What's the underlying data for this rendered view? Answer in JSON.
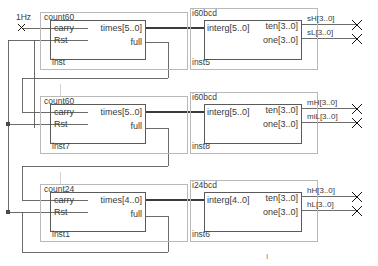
{
  "diagram": {
    "type": "block-schematic",
    "tool_style": "quartus-bdf",
    "clock_label": "1Hz",
    "bottom_mark": "I",
    "rows": [
      {
        "counter": {
          "title": "count60",
          "instance": "inst",
          "inputs": [
            "carry",
            "Rst"
          ],
          "outputs": [
            "times[5..0]",
            "full"
          ]
        },
        "decoder": {
          "title": "i60bcd",
          "instance": "inst5",
          "inputs": [
            "interg[5..0]"
          ],
          "outputs": [
            "ten[3..0]",
            "one[3..0]"
          ]
        },
        "nets": [
          "sH[3..0]",
          "sL[3..0]"
        ]
      },
      {
        "counter": {
          "title": "count60",
          "instance": "inst7",
          "inputs": [
            "carry",
            "Rst"
          ],
          "outputs": [
            "times[5..0]",
            "full"
          ]
        },
        "decoder": {
          "title": "i60bcd",
          "instance": "inst8",
          "inputs": [
            "interg[5..0]"
          ],
          "outputs": [
            "ten[3..0]",
            "one[3..0]"
          ]
        },
        "nets": [
          "mH[3..0]",
          "miL[3..0]"
        ]
      },
      {
        "counter": {
          "title": "count24",
          "instance": "inst1",
          "inputs": [
            "carry",
            "Rst"
          ],
          "outputs": [
            "times[4..0]",
            "full"
          ]
        },
        "decoder": {
          "title": "i24bcd",
          "instance": "inst6",
          "inputs": [
            "interg[4..0]"
          ],
          "outputs": [
            "ten[3..0]",
            "one[3..0]"
          ]
        },
        "nets": [
          "hH[3..0]",
          "hL[3..0]"
        ]
      }
    ],
    "colors": {
      "wire": "#555555",
      "bus": "#3b3b3b",
      "block_border": "#5a5a5a",
      "group_border": "#b9b9b9",
      "text": "#3a3a3a",
      "pin_marker": "#111111"
    }
  }
}
